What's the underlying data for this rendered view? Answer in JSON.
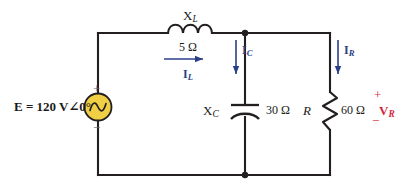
{
  "diagram": {
    "source": {
      "label": "E = 120 V∠0°",
      "symbol": "ac-voltage-source",
      "plus_sign": "+",
      "minus_sign": "−",
      "fill_color": "#F0CF45",
      "stroke_color": "#1a1a1a"
    },
    "elements": [
      {
        "name": "inductor",
        "symbol_label": "X",
        "symbol_subscript": "L",
        "value": "5 Ω"
      },
      {
        "name": "capacitor",
        "symbol_label": "X",
        "symbol_subscript": "C",
        "value": "30 Ω"
      },
      {
        "name": "resistor",
        "symbol_label": "R",
        "symbol_subscript": "",
        "value": "60 Ω"
      }
    ],
    "currents": [
      {
        "name": "inductor-current",
        "label": "I",
        "subscript": "L",
        "direction": "right",
        "color": "#2b3f87"
      },
      {
        "name": "capacitor-current",
        "label": "I",
        "subscript": "C",
        "direction": "down",
        "color": "#2b3f87"
      },
      {
        "name": "resistor-current",
        "label": "I",
        "subscript": "R",
        "direction": "down",
        "color": "#2b3f87"
      }
    ],
    "voltages": [
      {
        "name": "resistor-voltage",
        "label": "V",
        "subscript": "R",
        "plus_sign": "+",
        "minus_sign": "−",
        "color": "#d6263c"
      }
    ]
  }
}
